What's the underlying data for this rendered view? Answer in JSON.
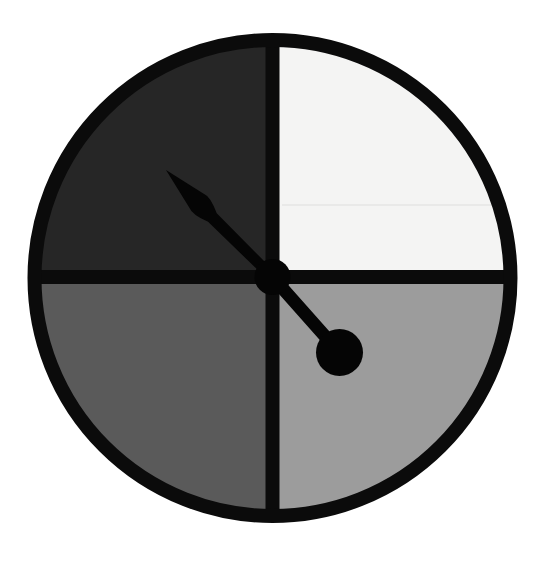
{
  "page": {
    "background_color": "#ffffff",
    "width": 547,
    "height": 563
  },
  "dial": {
    "label": "quadrant-dial",
    "center_x": 272.5,
    "center_y": 278,
    "outer_radius": 245,
    "ring_color": "#0b0b0b",
    "ring_thickness": 14,
    "face_radius": 238,
    "crosshair_thickness": 14,
    "crosshair_color": "#0b0b0b",
    "quadrants": [
      {
        "name": "top-left-quadrant",
        "position": "top-left",
        "start_angle_deg": 180,
        "end_angle_deg": 270,
        "fill": "#262626",
        "tone": "very dark gray"
      },
      {
        "name": "top-right-quadrant",
        "position": "top-right",
        "start_angle_deg": 270,
        "end_angle_deg": 360,
        "fill": "#f4f4f3",
        "tone": "near white"
      },
      {
        "name": "bottom-right-quadrant",
        "position": "bottom-right",
        "start_angle_deg": 0,
        "end_angle_deg": 90,
        "fill": "#9c9c9c",
        "tone": "light gray"
      },
      {
        "name": "bottom-left-quadrant",
        "position": "bottom-left",
        "start_angle_deg": 90,
        "end_angle_deg": 180,
        "fill": "#5a5a5a",
        "tone": "dark gray"
      }
    ],
    "seam_artifact": {
      "name": "print-seam-line",
      "y": 205,
      "x_start": 282,
      "x_end": 505,
      "color": "#e9e9e8"
    }
  },
  "pointer": {
    "label": "dial-pointer-needle",
    "color": "#050505",
    "angle_deg": 225,
    "pivot_x": 272.5,
    "pivot_y": 277,
    "hub_radius": 18,
    "needle_tip_x": 166,
    "needle_tip_y": 170,
    "needle_length": 151,
    "needle_max_width": 26,
    "counterweight_center_x": 339.5,
    "counterweight_center_y": 352.5,
    "counterweight_radius": 23.5,
    "tail_length": 95,
    "tail_width": 13
  },
  "a11y": {
    "figure_description": "A circular dial divided into four equal quadrants shaded in a four-step grayscale ramp, with a black spear-shaped pointer needle aimed toward the upper-left quadrant and a round counterweight on the opposite tail."
  }
}
